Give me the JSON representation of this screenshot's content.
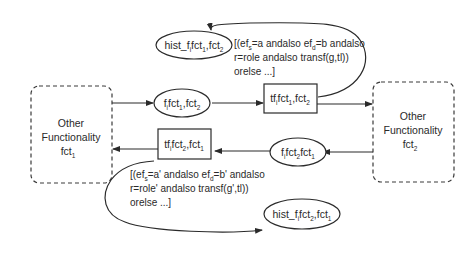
{
  "diagram": {
    "left_block": {
      "line1": "Other",
      "line2": "Functionality",
      "line3_base": "fct",
      "line3_sub": "1"
    },
    "right_block": {
      "line1": "Other",
      "line2": "Functionality",
      "line3_base": "fct",
      "line3_sub": "2"
    },
    "place_f_fct1_fct2": {
      "parts": [
        "f",
        "i",
        "fct",
        "1",
        ",fct",
        "2"
      ]
    },
    "place_f_fct2_fct1": {
      "parts": [
        "f",
        "i",
        "fct",
        "2",
        "fct",
        "1"
      ]
    },
    "transition_tf_fct1_fct2": {
      "parts": [
        "tf",
        "i",
        "fct",
        "1",
        ",fct",
        "2"
      ]
    },
    "transition_tf_fct2_fct1": {
      "parts": [
        "tf",
        "i",
        "fct",
        "2",
        ",fct",
        "1"
      ]
    },
    "hist_fct1_fct2": {
      "parts": [
        "hist_f",
        "i",
        "fct",
        "1",
        ",fct",
        "2"
      ]
    },
    "hist_fct2_fct1": {
      "parts": [
        "hist_f",
        "i",
        "fct",
        "2",
        ",fct",
        "1"
      ]
    },
    "guard_top": {
      "line1_a": "[(ef",
      "line1_s": "s",
      "line1_b": "=a andalso ef",
      "line1_d": "d",
      "line1_c": "=b andalso",
      "line2": "r=role andalso transf(g,tl))",
      "line3": "orelse ...]"
    },
    "guard_bottom": {
      "line1_a": "[(ef",
      "line1_s": "s",
      "line1_b": "=a' andalso ef",
      "line1_d": "d",
      "line1_c": "=b' andalso",
      "line2": "r=role' andalso transf(g',tl))",
      "line3": "orelse ...]"
    },
    "colors": {
      "stroke": "#2a2a2a",
      "background": "#ffffff"
    }
  }
}
